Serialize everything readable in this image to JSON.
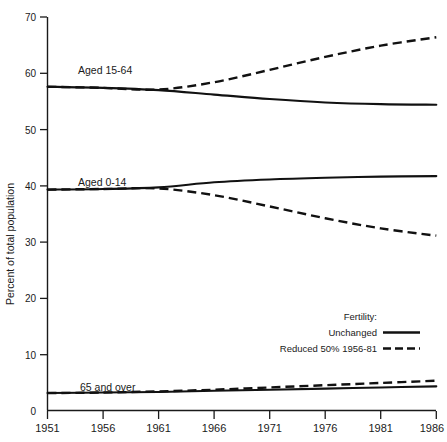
{
  "chart_data": {
    "type": "line",
    "title": "",
    "xlabel": "",
    "ylabel": "Percent of total population",
    "xlim": [
      1951,
      1986
    ],
    "ylim": [
      0,
      70
    ],
    "yticks": [
      0,
      10,
      20,
      30,
      40,
      50,
      60,
      70
    ],
    "xticks": [
      1951,
      1956,
      1961,
      1966,
      1971,
      1976,
      1981,
      1986
    ],
    "grid": false,
    "legend_position": "lower-right",
    "legend_title": "Fertility:",
    "legend_entries": [
      {
        "label": "Unchanged",
        "style": "solid"
      },
      {
        "label": "Reduced 50% 1956-81",
        "style": "dashed"
      }
    ],
    "annotations": [
      {
        "text": "Aged 15-64",
        "x": 1955.4,
        "y": 60.2
      },
      {
        "text": "Aged 0-14",
        "x": 1955.4,
        "y": 41.8
      },
      {
        "text": "65 and over",
        "x": 1955.6,
        "y": 5.9
      }
    ],
    "x": [
      1951,
      1956,
      1961,
      1966,
      1971,
      1976,
      1981,
      1986
    ],
    "series": [
      {
        "name": "Aged 15-64 — Unchanged",
        "group": "Aged 15-64",
        "style": "solid",
        "values": [
          57.6,
          57.4,
          57.0,
          56.2,
          55.4,
          54.8,
          54.5,
          54.4
        ]
      },
      {
        "name": "Aged 15-64 — Reduced 50% 1956-81",
        "group": "Aged 15-64",
        "style": "dashed",
        "values": [
          57.6,
          57.4,
          57.1,
          58.4,
          60.6,
          62.9,
          64.9,
          66.4
        ]
      },
      {
        "name": "Aged 0-14 — Unchanged",
        "group": "Aged 0-14",
        "style": "solid",
        "values": [
          39.3,
          39.4,
          39.7,
          40.6,
          41.1,
          41.4,
          41.6,
          41.7
        ]
      },
      {
        "name": "Aged 0-14 — Reduced 50% 1956-81",
        "group": "Aged 0-14",
        "style": "dashed",
        "values": [
          39.3,
          39.4,
          39.5,
          38.3,
          36.3,
          34.2,
          32.4,
          31.1
        ]
      },
      {
        "name": "65 and over — Unchanged",
        "group": "65 and over",
        "style": "solid",
        "values": [
          3.1,
          3.2,
          3.3,
          3.5,
          3.7,
          3.9,
          4.1,
          4.3
        ]
      },
      {
        "name": "65 and over — Reduced 50% 1956-81",
        "group": "65 and over",
        "style": "dashed",
        "values": [
          3.1,
          3.2,
          3.4,
          3.7,
          4.1,
          4.5,
          4.9,
          5.3
        ]
      }
    ]
  },
  "axis": {
    "y_title": "Percent of total population",
    "y_tick_labels": [
      "70",
      "60",
      "50",
      "40",
      "30",
      "20",
      "10",
      "0"
    ],
    "x_tick_labels": [
      "1951",
      "1956",
      "1961",
      "1966",
      "1971",
      "1976",
      "1981",
      "1986"
    ]
  },
  "labels": {
    "aged_15_64": "Aged 15-64",
    "aged_0_14": "Aged 0-14",
    "aged_65_over": "65 and over"
  },
  "legend": {
    "title": "Fertility:",
    "unchanged": "Unchanged",
    "reduced": "Reduced 50% 1956-81"
  }
}
